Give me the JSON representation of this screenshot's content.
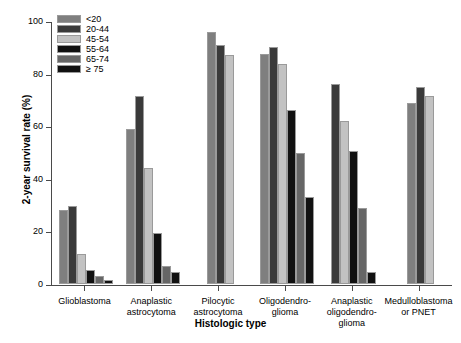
{
  "chart_data": {
    "type": "bar",
    "title": "",
    "xlabel": "Histologic type",
    "ylabel": "2-year survival rate (%)",
    "ylim": [
      0,
      100
    ],
    "yticks": [
      0,
      20,
      40,
      60,
      80,
      100
    ],
    "ytick_labels": [
      "0",
      "20",
      "40",
      "60",
      "80",
      "100"
    ],
    "grid": false,
    "legend_position": "top-left",
    "legend_title": "",
    "categories": [
      "Glioblastoma",
      "Anaplastic astrocytoma",
      "Pilocytic astrocytoma",
      "Oligodendro-glioma",
      "Anaplastic oligodendro-glioma",
      "Medulloblastoma or PNET"
    ],
    "category_lines": [
      [
        "Glioblastoma"
      ],
      [
        "Anaplastic",
        "astrocytoma"
      ],
      [
        "Pilocytic",
        "astrocytoma"
      ],
      [
        "Oligodendro-",
        "glioma"
      ],
      [
        "Anaplastic",
        "oligodendro-",
        "glioma"
      ],
      [
        "Medulloblastoma",
        "or PNET"
      ]
    ],
    "series": [
      {
        "name": "<20",
        "color": "#7f7f7f",
        "values": [
          28.0,
          59.0,
          96.0,
          87.5,
          null,
          69.0
        ]
      },
      {
        "name": "20-44",
        "color": "#3a3a3a",
        "values": [
          29.5,
          71.5,
          91.0,
          90.0,
          76.0,
          75.0
        ]
      },
      {
        "name": "45-54",
        "color": "#c2c2c2",
        "values": [
          11.5,
          44.0,
          87.0,
          83.5,
          62.0,
          71.5
        ]
      },
      {
        "name": "55-64",
        "color": "#111111",
        "values": [
          5.5,
          19.5,
          null,
          66.0,
          50.5,
          null
        ]
      },
      {
        "name": "65-74",
        "color": "#666666",
        "values": [
          3.0,
          7.0,
          null,
          50.0,
          29.0,
          null
        ]
      },
      {
        "name": "≥ 75",
        "color": "#111111",
        "values": [
          1.5,
          4.5,
          null,
          33.0,
          4.5,
          null
        ]
      }
    ]
  },
  "axis": {
    "y_title": "2-year survival rate (%)",
    "x_title": "Histologic type"
  }
}
